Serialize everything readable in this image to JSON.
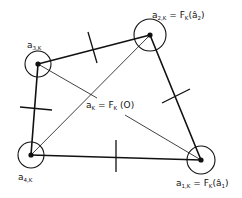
{
  "diagram": {
    "type": "quadrilateral-element-mapping",
    "colors": {
      "stroke": "#111111",
      "background": "#ffffff"
    },
    "nodes": [
      {
        "id": "a1",
        "base": "a",
        "subscript": "1,K",
        "suffix": " = F",
        "suffix_sub": "K",
        "arg": "(â",
        "arg_sub": "1",
        "close": ")",
        "x": 201,
        "y": 160,
        "r": 14
      },
      {
        "id": "a2",
        "base": "a",
        "subscript": "2,K",
        "suffix": " = F",
        "suffix_sub": "K",
        "arg": "(â",
        "arg_sub": "2",
        "close": ")",
        "x": 150,
        "y": 35,
        "r": 16
      },
      {
        "id": "a3",
        "base": "a",
        "subscript": "3,K",
        "x": 38,
        "y": 64,
        "r": 13
      },
      {
        "id": "a4",
        "base": "a",
        "subscript": "4,K",
        "x": 31,
        "y": 155,
        "r": 13
      }
    ],
    "center_label": {
      "base": "a",
      "subscript": "K",
      "eq": " = F",
      "eq_sub": "K",
      "arg": " (O)"
    },
    "edges": [
      {
        "from": "a3",
        "to": "a2",
        "weight": "thick",
        "tick": true
      },
      {
        "from": "a2",
        "to": "a1",
        "weight": "thick",
        "tick": true
      },
      {
        "from": "a1",
        "to": "a4",
        "weight": "thick",
        "tick": true
      },
      {
        "from": "a4",
        "to": "a3",
        "weight": "thick",
        "tick": true
      },
      {
        "from": "a4",
        "to": "a2",
        "weight": "thin",
        "tick": false
      }
    ]
  }
}
